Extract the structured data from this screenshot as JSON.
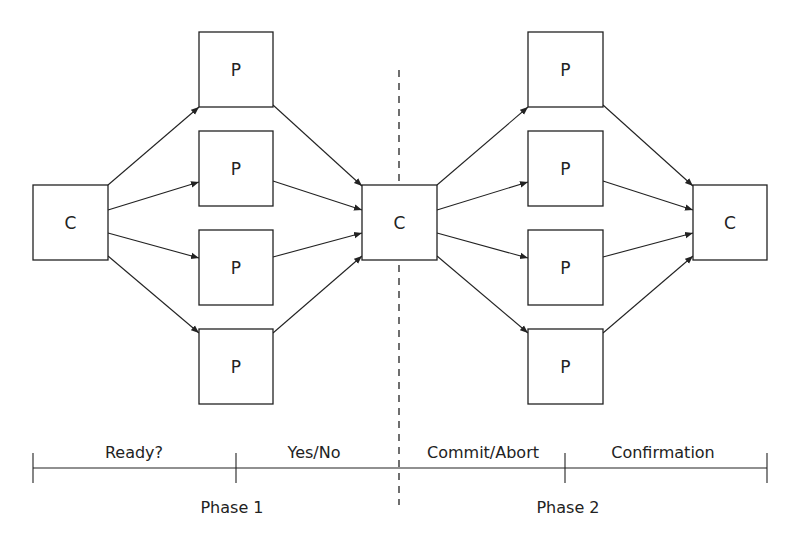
{
  "diagram": {
    "colors": {
      "stroke": "#222222",
      "background": "#ffffff"
    },
    "nodes": [
      {
        "id": "c1",
        "label": "C",
        "role": "coordinator",
        "x": 33,
        "y": 185,
        "w": 75,
        "h": 75
      },
      {
        "id": "p1a",
        "label": "P",
        "role": "participant",
        "x": 199,
        "y": 32,
        "w": 74,
        "h": 75
      },
      {
        "id": "p1b",
        "label": "P",
        "role": "participant",
        "x": 199,
        "y": 131,
        "w": 74,
        "h": 75
      },
      {
        "id": "p1c",
        "label": "P",
        "role": "participant",
        "x": 199,
        "y": 230,
        "w": 74,
        "h": 75
      },
      {
        "id": "p1d",
        "label": "P",
        "role": "participant",
        "x": 199,
        "y": 329,
        "w": 74,
        "h": 75
      },
      {
        "id": "c2",
        "label": "C",
        "role": "coordinator",
        "x": 362,
        "y": 185,
        "w": 75,
        "h": 75
      },
      {
        "id": "p2a",
        "label": "P",
        "role": "participant",
        "x": 528,
        "y": 32,
        "w": 75,
        "h": 75
      },
      {
        "id": "p2b",
        "label": "P",
        "role": "participant",
        "x": 528,
        "y": 131,
        "w": 75,
        "h": 75
      },
      {
        "id": "p2c",
        "label": "P",
        "role": "participant",
        "x": 528,
        "y": 230,
        "w": 75,
        "h": 75
      },
      {
        "id": "p2d",
        "label": "P",
        "role": "participant",
        "x": 528,
        "y": 329,
        "w": 75,
        "h": 75
      },
      {
        "id": "c3",
        "label": "C",
        "role": "coordinator",
        "x": 693,
        "y": 185,
        "w": 74,
        "h": 75
      }
    ],
    "edges": [
      {
        "from": "c1",
        "to": "p1a",
        "x1": 108,
        "y1": 185,
        "x2": 199,
        "y2": 107
      },
      {
        "from": "c1",
        "to": "p1b",
        "x1": 108,
        "y1": 210,
        "x2": 199,
        "y2": 182
      },
      {
        "from": "c1",
        "to": "p1c",
        "x1": 108,
        "y1": 233,
        "x2": 199,
        "y2": 258
      },
      {
        "from": "c1",
        "to": "p1d",
        "x1": 108,
        "y1": 256,
        "x2": 199,
        "y2": 333
      },
      {
        "from": "p1a",
        "to": "c2",
        "x1": 273,
        "y1": 105,
        "x2": 362,
        "y2": 186
      },
      {
        "from": "p1b",
        "to": "c2",
        "x1": 273,
        "y1": 181,
        "x2": 362,
        "y2": 210
      },
      {
        "from": "p1c",
        "to": "c2",
        "x1": 273,
        "y1": 257,
        "x2": 362,
        "y2": 233
      },
      {
        "from": "p1d",
        "to": "c2",
        "x1": 273,
        "y1": 333,
        "x2": 362,
        "y2": 256
      },
      {
        "from": "c2",
        "to": "p2a",
        "x1": 437,
        "y1": 185,
        "x2": 528,
        "y2": 107
      },
      {
        "from": "c2",
        "to": "p2b",
        "x1": 437,
        "y1": 210,
        "x2": 528,
        "y2": 182
      },
      {
        "from": "c2",
        "to": "p2c",
        "x1": 437,
        "y1": 233,
        "x2": 528,
        "y2": 258
      },
      {
        "from": "c2",
        "to": "p2d",
        "x1": 437,
        "y1": 256,
        "x2": 528,
        "y2": 333
      },
      {
        "from": "p2a",
        "to": "c3",
        "x1": 603,
        "y1": 105,
        "x2": 693,
        "y2": 186
      },
      {
        "from": "p2b",
        "to": "c3",
        "x1": 603,
        "y1": 181,
        "x2": 693,
        "y2": 210
      },
      {
        "from": "p2c",
        "to": "c3",
        "x1": 603,
        "y1": 257,
        "x2": 693,
        "y2": 233
      },
      {
        "from": "p2d",
        "to": "c3",
        "x1": 603,
        "y1": 333,
        "x2": 693,
        "y2": 256
      }
    ],
    "phase_divider": {
      "x": 399,
      "y1": 70,
      "y2": 505,
      "style": "dashed"
    },
    "timeline": {
      "y": 468,
      "x_start": 33,
      "x_end": 767,
      "ticks": [
        33,
        236,
        565,
        767
      ],
      "segments": [
        {
          "label": "Ready?",
          "x": 134
        },
        {
          "label": "Yes/No",
          "x": 314
        },
        {
          "label": "Commit/Abort",
          "x": 483
        },
        {
          "label": "Confirmation",
          "x": 663
        }
      ],
      "phases": [
        {
          "label": "Phase 1",
          "x": 232
        },
        {
          "label": "Phase 2",
          "x": 568
        }
      ]
    }
  }
}
